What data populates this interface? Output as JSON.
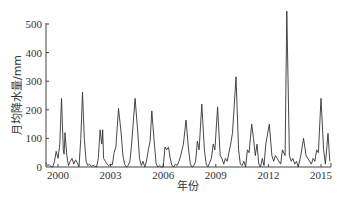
{
  "chart_data": {
    "type": "line",
    "title": "",
    "xlabel": "年份",
    "ylabel": "月均降水量/mm",
    "ylim": [
      0,
      500
    ],
    "yticks": [
      0,
      100,
      200,
      300,
      400,
      500
    ],
    "xlim": [
      1999.3,
      2015.6
    ],
    "xticks": [
      2000,
      2003,
      2006,
      2009,
      2012,
      2015
    ],
    "grid": false,
    "legend": null,
    "series": [
      {
        "name": "月均降水量",
        "color": "#333333",
        "points": [
          [
            1999.3,
            15
          ],
          [
            1999.4,
            5
          ],
          [
            1999.5,
            8
          ],
          [
            1999.6,
            2
          ],
          [
            1999.7,
            0
          ],
          [
            1999.8,
            20
          ],
          [
            1999.9,
            55
          ],
          [
            2000.0,
            30
          ],
          [
            2000.1,
            80
          ],
          [
            2000.2,
            240
          ],
          [
            2000.3,
            60
          ],
          [
            2000.35,
            45
          ],
          [
            2000.4,
            120
          ],
          [
            2000.5,
            40
          ],
          [
            2000.6,
            5
          ],
          [
            2000.7,
            20
          ],
          [
            2000.8,
            30
          ],
          [
            2000.9,
            10
          ],
          [
            2001.0,
            25
          ],
          [
            2001.1,
            15
          ],
          [
            2001.2,
            0
          ],
          [
            2001.3,
            100
          ],
          [
            2001.4,
            262
          ],
          [
            2001.5,
            100
          ],
          [
            2001.6,
            20
          ],
          [
            2001.7,
            5
          ],
          [
            2001.8,
            10
          ],
          [
            2001.9,
            2
          ],
          [
            2002.0,
            5
          ],
          [
            2002.1,
            3
          ],
          [
            2002.2,
            0
          ],
          [
            2002.3,
            30
          ],
          [
            2002.4,
            130
          ],
          [
            2002.5,
            80
          ],
          [
            2002.55,
            130
          ],
          [
            2002.6,
            30
          ],
          [
            2002.7,
            20
          ],
          [
            2002.8,
            10
          ],
          [
            2002.9,
            5
          ],
          [
            2003.0,
            10
          ],
          [
            2003.1,
            8
          ],
          [
            2003.2,
            50
          ],
          [
            2003.3,
            70
          ],
          [
            2003.45,
            205
          ],
          [
            2003.6,
            120
          ],
          [
            2003.7,
            40
          ],
          [
            2003.8,
            10
          ],
          [
            2003.9,
            0
          ],
          [
            2004.0,
            5
          ],
          [
            2004.1,
            20
          ],
          [
            2004.2,
            80
          ],
          [
            2004.4,
            240
          ],
          [
            2004.55,
            120
          ],
          [
            2004.65,
            30
          ],
          [
            2004.75,
            5
          ],
          [
            2004.85,
            20
          ],
          [
            2004.95,
            0
          ],
          [
            2005.05,
            20
          ],
          [
            2005.15,
            60
          ],
          [
            2005.25,
            90
          ],
          [
            2005.35,
            196
          ],
          [
            2005.5,
            80
          ],
          [
            2005.6,
            10
          ],
          [
            2005.7,
            0
          ],
          [
            2005.8,
            5
          ],
          [
            2005.9,
            0
          ],
          [
            2006.0,
            0
          ],
          [
            2006.1,
            70
          ],
          [
            2006.2,
            60
          ],
          [
            2006.3,
            70
          ],
          [
            2006.4,
            30
          ],
          [
            2006.5,
            5
          ],
          [
            2006.6,
            0
          ],
          [
            2006.7,
            10
          ],
          [
            2006.8,
            5
          ],
          [
            2006.9,
            20
          ],
          [
            2007.0,
            40
          ],
          [
            2007.15,
            80
          ],
          [
            2007.3,
            164
          ],
          [
            2007.45,
            60
          ],
          [
            2007.55,
            10
          ],
          [
            2007.65,
            0
          ],
          [
            2007.75,
            5
          ],
          [
            2007.85,
            20
          ],
          [
            2007.95,
            90
          ],
          [
            2008.05,
            60
          ],
          [
            2008.2,
            220
          ],
          [
            2008.35,
            60
          ],
          [
            2008.45,
            10
          ],
          [
            2008.55,
            0
          ],
          [
            2008.65,
            15
          ],
          [
            2008.75,
            30
          ],
          [
            2008.85,
            80
          ],
          [
            2008.95,
            60
          ],
          [
            2009.1,
            210
          ],
          [
            2009.25,
            40
          ],
          [
            2009.35,
            30
          ],
          [
            2009.45,
            10
          ],
          [
            2009.55,
            30
          ],
          [
            2009.65,
            20
          ],
          [
            2009.75,
            50
          ],
          [
            2009.85,
            80
          ],
          [
            2009.95,
            120
          ],
          [
            2010.15,
            315
          ],
          [
            2010.3,
            60
          ],
          [
            2010.4,
            10
          ],
          [
            2010.5,
            5
          ],
          [
            2010.6,
            20
          ],
          [
            2010.7,
            0
          ],
          [
            2010.8,
            60
          ],
          [
            2010.9,
            50
          ],
          [
            2011.05,
            150
          ],
          [
            2011.15,
            100
          ],
          [
            2011.25,
            40
          ],
          [
            2011.35,
            80
          ],
          [
            2011.45,
            10
          ],
          [
            2011.55,
            0
          ],
          [
            2011.65,
            30
          ],
          [
            2011.75,
            5
          ],
          [
            2011.85,
            80
          ],
          [
            2012.05,
            150
          ],
          [
            2012.2,
            40
          ],
          [
            2012.3,
            20
          ],
          [
            2012.4,
            40
          ],
          [
            2012.5,
            30
          ],
          [
            2012.6,
            20
          ],
          [
            2012.7,
            10
          ],
          [
            2012.8,
            60
          ],
          [
            2012.95,
            40
          ],
          [
            2013.05,
            545
          ],
          [
            2013.2,
            40
          ],
          [
            2013.3,
            20
          ],
          [
            2013.4,
            30
          ],
          [
            2013.5,
            10
          ],
          [
            2013.6,
            20
          ],
          [
            2013.7,
            0
          ],
          [
            2013.85,
            40
          ],
          [
            2014.0,
            100
          ],
          [
            2014.15,
            40
          ],
          [
            2014.25,
            30
          ],
          [
            2014.35,
            20
          ],
          [
            2014.45,
            10
          ],
          [
            2014.55,
            30
          ],
          [
            2014.65,
            20
          ],
          [
            2014.75,
            60
          ],
          [
            2014.85,
            50
          ],
          [
            2015.0,
            240
          ],
          [
            2015.15,
            60
          ],
          [
            2015.25,
            10
          ],
          [
            2015.4,
            118
          ],
          [
            2015.5,
            20
          ]
        ]
      }
    ]
  }
}
